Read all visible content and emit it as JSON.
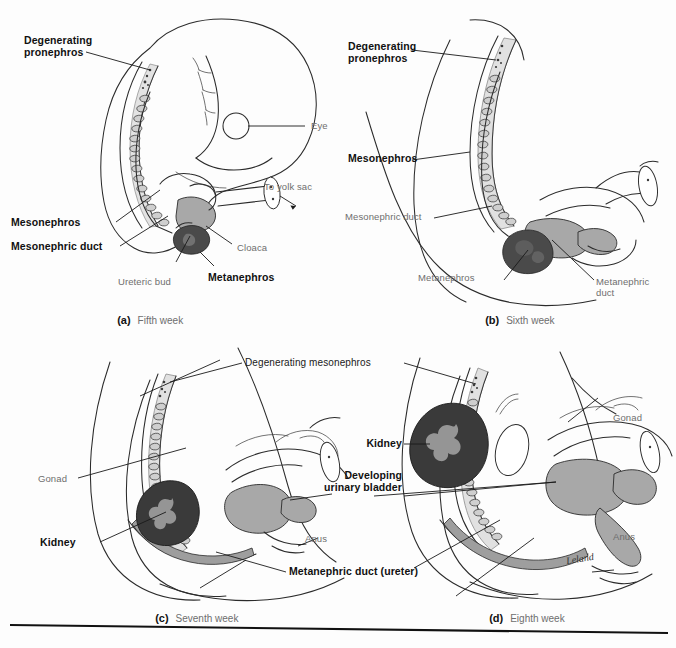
{
  "figure": {
    "background_color": "#fdfdfd",
    "signature": "Leland"
  },
  "palette": {
    "outline": "#2b2b2b",
    "leader_line": "#1a1a1a",
    "bold_label": "#111111",
    "light_label": "#6e6e6e",
    "mesonephros_fill": "#9e9e9e",
    "mesonephros_light": "#c9c9c9",
    "cloaca_fill": "#a8a8a8",
    "metanephros_fill": "#4a4a4a",
    "kidney_fill": "#3a3a3a",
    "kidney_pelvis": "#a0a0a0",
    "body_fill": "#ffffff",
    "rule": "#111111"
  },
  "panels": [
    {
      "id": "a",
      "caption_letter": "(a)",
      "caption_text": "Fifth week",
      "labels": [
        {
          "key": "degenerating-pronephros",
          "text": "Degenerating\npronephros",
          "style": "bold",
          "align": "left"
        },
        {
          "key": "eye",
          "text": "Eye",
          "style": "light",
          "align": "left"
        },
        {
          "key": "to-yolk-sac",
          "text": "To yolk sac",
          "style": "light",
          "align": "left"
        },
        {
          "key": "mesonephros",
          "text": "Mesonephros",
          "style": "bold",
          "align": "left"
        },
        {
          "key": "mesonephric-duct",
          "text": "Mesonephric duct",
          "style": "bold",
          "align": "left"
        },
        {
          "key": "cloaca",
          "text": "Cloaca",
          "style": "light",
          "align": "left"
        },
        {
          "key": "ureteric-bud",
          "text": "Ureteric bud",
          "style": "light",
          "align": "left"
        },
        {
          "key": "metanephros",
          "text": "Metanephros",
          "style": "bold",
          "align": "left"
        }
      ]
    },
    {
      "id": "b",
      "caption_letter": "(b)",
      "caption_text": "Sixth week",
      "labels": [
        {
          "key": "degenerating-pronephros",
          "text": "Degenerating\npronephros",
          "style": "bold",
          "align": "left"
        },
        {
          "key": "mesonephros",
          "text": "Mesonephros",
          "style": "bold",
          "align": "left"
        },
        {
          "key": "mesonephric-duct",
          "text": "Mesonephric duct",
          "style": "light",
          "align": "left"
        },
        {
          "key": "metanephros",
          "text": "Metanephros",
          "style": "light",
          "align": "left"
        },
        {
          "key": "metanephric-duct",
          "text": "Metanephric\nduct",
          "style": "light",
          "align": "left"
        }
      ]
    },
    {
      "id": "c",
      "caption_letter": "(c)",
      "caption_text": "Seventh week",
      "labels": [
        {
          "key": "gonad",
          "text": "Gonad",
          "style": "light",
          "align": "left"
        },
        {
          "key": "kidney",
          "text": "Kidney",
          "style": "bold",
          "align": "left"
        },
        {
          "key": "anus",
          "text": "Anus",
          "style": "light",
          "align": "left"
        }
      ]
    },
    {
      "id": "d",
      "caption_letter": "(d)",
      "caption_text": "Eighth week",
      "labels": [
        {
          "key": "kidney",
          "text": "Kidney",
          "style": "bold",
          "align": "right"
        },
        {
          "key": "gonad",
          "text": "Gonad",
          "style": "light",
          "align": "left"
        },
        {
          "key": "anus",
          "text": "Anus",
          "style": "light",
          "align": "left"
        }
      ]
    }
  ],
  "shared_labels": [
    {
      "key": "degenerating-mesonephros",
      "text": "Degenerating mesonephros",
      "style": "dark-reg"
    },
    {
      "key": "developing-urinary-bladder",
      "text": "Developing\nurinary bladder",
      "style": "bold"
    },
    {
      "key": "metanephric-duct-ureter",
      "text": "Metanephric duct (ureter)",
      "style": "bold"
    }
  ]
}
